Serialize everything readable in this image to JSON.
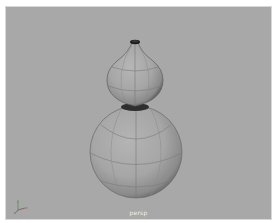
{
  "viewport": {
    "camera_label": "persp",
    "background_color": "#a8a8a8",
    "axis_labels": {
      "x": "x",
      "y": "y",
      "z": "z"
    }
  },
  "scene": {
    "object": "gourd",
    "display_mode": "smooth-shaded-wireframe-on-shaded",
    "parts": [
      {
        "name": "neck-tip",
        "shape": "cap"
      },
      {
        "name": "upper-bulb",
        "shape": "sphere"
      },
      {
        "name": "waist",
        "shape": "ring"
      },
      {
        "name": "lower-bulb",
        "shape": "sphere"
      }
    ]
  }
}
